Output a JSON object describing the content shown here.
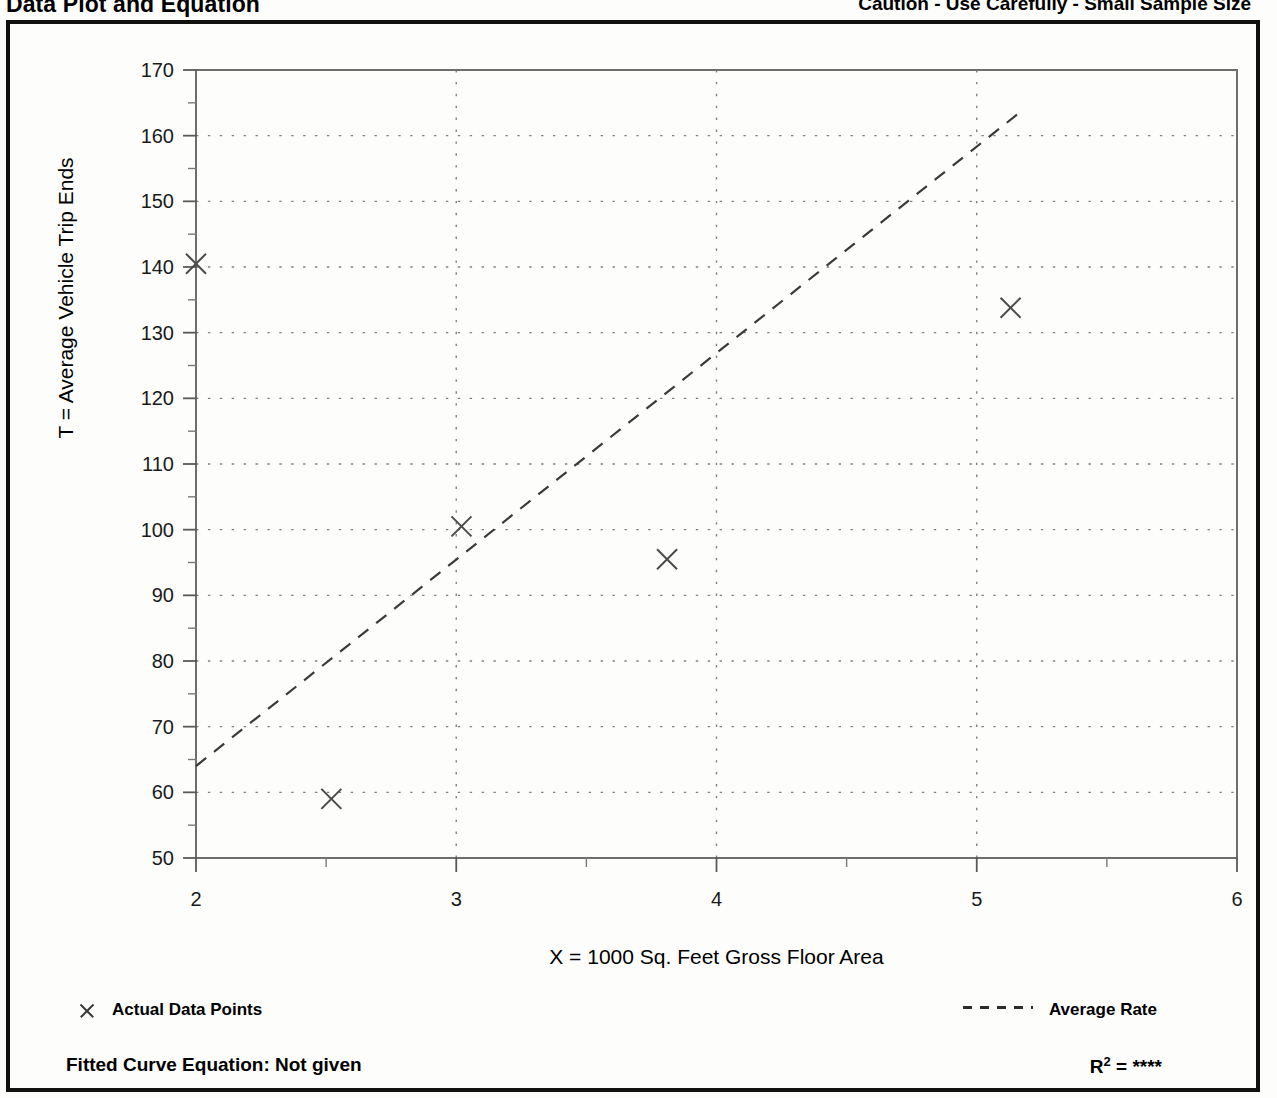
{
  "header": {
    "title": "Data Plot and Equation",
    "caution": "Caution - Use Carefully - Small Sample Size"
  },
  "legend": {
    "data_points_label": "Actual Data Points",
    "average_rate_label": "Average Rate",
    "marker_icon": "x-marker-icon",
    "line_icon": "dashed-line-icon"
  },
  "footer": {
    "equation_label": "Fitted Curve Equation:  Not given",
    "r2_prefix": "R",
    "r2_exponent": "2",
    "r2_value": "= ****"
  },
  "chart_data": {
    "type": "scatter",
    "title": "Data Plot and Equation",
    "xlabel": "X = 1000 Sq. Feet Gross Floor Area",
    "ylabel": "T = Average Vehicle Trip Ends",
    "xlim": [
      2,
      6
    ],
    "ylim": [
      50,
      170
    ],
    "xticks": [
      2,
      3,
      4,
      5,
      6
    ],
    "xtick_labels": [
      "2",
      "3",
      "4",
      "5",
      "6"
    ],
    "xminor_step": 0.5,
    "yticks": [
      50,
      60,
      70,
      80,
      90,
      100,
      110,
      120,
      130,
      140,
      150,
      160,
      170
    ],
    "ytick_labels": [
      "50",
      "60",
      "70",
      "80",
      "90",
      "100",
      "110",
      "120",
      "130",
      "140",
      "150",
      "160",
      "170"
    ],
    "yminor_step": 5,
    "grid": "dotted",
    "grid_x": [
      3,
      4,
      5
    ],
    "grid_y": [
      60,
      70,
      80,
      90,
      100,
      110,
      120,
      130,
      140,
      150,
      160
    ],
    "legend_position": "below-plot",
    "series": [
      {
        "name": "Actual Data Points",
        "type": "scatter",
        "marker": "x",
        "color": "#4a4a4a",
        "points": [
          {
            "x": 2.0,
            "y": 140.5
          },
          {
            "x": 2.52,
            "y": 59.0
          },
          {
            "x": 3.02,
            "y": 100.5
          },
          {
            "x": 3.81,
            "y": 95.5
          },
          {
            "x": 5.13,
            "y": 133.8
          }
        ]
      },
      {
        "name": "Average Rate",
        "type": "line",
        "style": "dashed",
        "color": "#3a3a3a",
        "points": [
          {
            "x": 2.0,
            "y": 64.0
          },
          {
            "x": 5.18,
            "y": 164.0
          }
        ]
      }
    ],
    "fitted_curve_equation": "Not given",
    "r_squared": "****"
  }
}
